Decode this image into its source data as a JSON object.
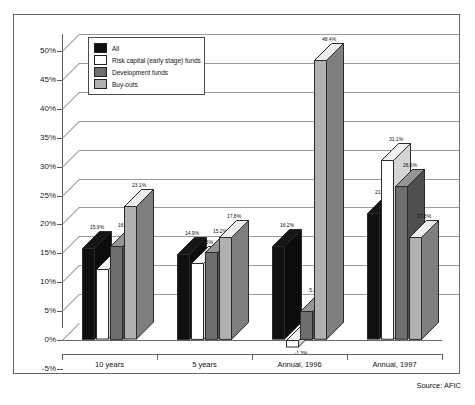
{
  "chart_data": {
    "type": "bar",
    "title": "",
    "subtitle": "",
    "xlabel": "",
    "ylabel": "",
    "ylim": [
      -5,
      50
    ],
    "ytick_step": 5,
    "ytick_labels": [
      "50%",
      "45%",
      "40%",
      "35%",
      "30%",
      "25%",
      "20%",
      "15%",
      "10%",
      "5%",
      "0%",
      "-5%"
    ],
    "ytick_values": [
      50,
      45,
      40,
      35,
      30,
      25,
      20,
      15,
      10,
      5,
      0,
      -5
    ],
    "grid": true,
    "legend_position": "top-left-inside",
    "categories": [
      "10 years",
      "5 years",
      "Annual, 1996",
      "Annual, 1997"
    ],
    "series": [
      {
        "name": "All",
        "color": "#101010",
        "values": [
          15.9,
          14.9,
          16.2,
          21.9
        ],
        "labels": [
          "15.9%",
          "14.9%",
          "16.2%",
          "21.9%"
        ]
      },
      {
        "name": "Risk capital (early stage) funds",
        "color": "#ffffff",
        "values": [
          12.2,
          13.3,
          -1.3,
          31.1
        ],
        "labels": [
          "12.2%",
          "13.3%",
          "-1.3%",
          "31.1%"
        ]
      },
      {
        "name": "Development funds",
        "color": "#6e6e6e",
        "values": [
          16.3,
          15.2,
          5.0,
          26.6
        ],
        "labels": [
          "16.3%",
          "15.2%",
          "5.0%",
          "26.6%"
        ]
      },
      {
        "name": "Buy-outs",
        "color": "#b0b0b0",
        "values": [
          23.1,
          17.8,
          48.4,
          17.8
        ],
        "labels": [
          "23.1%",
          "17.8%",
          "48.4%",
          "17.8%"
        ]
      }
    ],
    "source": "Source: AFIC"
  },
  "legend": {
    "items": [
      {
        "label": "All",
        "color": "#101010"
      },
      {
        "label": "Risk capital (early stage) funds",
        "color": "#ffffff"
      },
      {
        "label": "Development funds",
        "color": "#6e6e6e"
      },
      {
        "label": "Buy-outs",
        "color": "#b0b0b0"
      }
    ]
  },
  "footer": {
    "source": "Source: AFIC"
  }
}
